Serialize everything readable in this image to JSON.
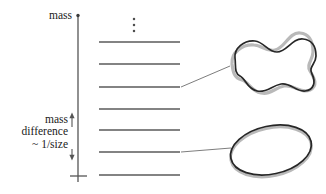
{
  "figure": {
    "name": "string-mass-spectrum-diagram",
    "background_color": "#ffffff",
    "width": 326,
    "height": 194
  },
  "axis": {
    "label": "mass",
    "color": "#555555",
    "x": 78,
    "y_top": 15,
    "y_bottom": 182,
    "tick_top_y": 15,
    "baseline_tick": {
      "y": 176,
      "x_start": 70,
      "x_end": 87
    }
  },
  "annotation": {
    "line1": "mass",
    "line2": "difference",
    "line3": "~ 1/size",
    "arrow": {
      "x": 72,
      "y_top": 113,
      "y_bottom": 160,
      "color": "#555555",
      "double_headed": true
    }
  },
  "ellipsis": {
    "symbol": "vertical-dots",
    "x": 134,
    "dots": [
      19,
      25,
      31
    ],
    "color": "#555555"
  },
  "levels": {
    "x_start": 99,
    "x_end": 180,
    "color": "#5a5a5a",
    "thickness": 1.6,
    "y_positions": [
      42,
      64,
      87,
      109,
      130,
      152,
      175
    ],
    "count": 7
  },
  "connectors": [
    {
      "name": "connector-to-excited-string",
      "from_level_index": 2,
      "x1": 181,
      "y1": 87,
      "x2": 230,
      "y2": 66,
      "color": "#6e6e6e"
    },
    {
      "name": "connector-to-ground-string",
      "from_level_index": 5,
      "x1": 181,
      "y1": 152,
      "x2": 231,
      "y2": 148,
      "color": "#6e6e6e"
    }
  ],
  "shapes": [
    {
      "name": "excited-string-loop",
      "description": "wobbly oscillating closed string with gray ghost outline",
      "outline_color": "#262626",
      "shadow_color": "#b5b5b5",
      "fill": "none",
      "center_x": 270,
      "center_y": 54
    },
    {
      "name": "ground-state-string-loop",
      "description": "smooth tilted elliptical closed string with gray ghost outline",
      "outline_color": "#262626",
      "shadow_color": "#b5b5b5",
      "fill": "none",
      "center_x": 270,
      "center_y": 150
    }
  ],
  "colors": {
    "ink": "#1a1a1a",
    "level_gray": "#5a5a5a",
    "axis_gray": "#555555",
    "shape_outline": "#262626",
    "shape_shadow": "#b5b5b5",
    "background": "#ffffff"
  }
}
